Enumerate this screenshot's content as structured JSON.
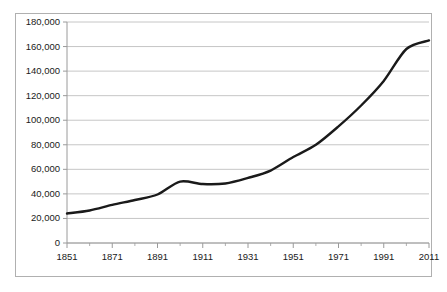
{
  "chart_data": {
    "type": "line",
    "title": "",
    "subtitle": "",
    "xlabel": "",
    "ylabel": "",
    "xlim": [
      1851,
      2011
    ],
    "ylim": [
      0,
      180000
    ],
    "grid": true,
    "grid_axis": "y",
    "legend": false,
    "legend_position": "none",
    "line_color": "#1a1a1a",
    "line_width": 2.4,
    "plot_background": "#ffffff",
    "gridline_color": "#bfbfbf",
    "axis_color": "#9a9a9a",
    "border_color": "#b0b0b0",
    "y_ticks": [
      0,
      20000,
      40000,
      60000,
      80000,
      100000,
      120000,
      140000,
      160000,
      180000
    ],
    "y_tick_labels": [
      "0",
      "20,000",
      "40,000",
      "60,000",
      "80,000",
      "100,000",
      "120,000",
      "140,000",
      "160,000",
      "180,000"
    ],
    "x_ticks": [
      1851,
      1871,
      1891,
      1911,
      1931,
      1951,
      1971,
      1991,
      2011
    ],
    "x_tick_labels": [
      "1851",
      "1871",
      "1891",
      "1911",
      "1931",
      "1951",
      "1971",
      "1991",
      "2011"
    ],
    "x_minor_ticks": [
      1861,
      1881,
      1901,
      1921,
      1941,
      1961,
      1981,
      2001
    ],
    "series": [
      {
        "name": "Population",
        "x": [
          1851,
          1861,
          1871,
          1881,
          1891,
          1901,
          1911,
          1921,
          1931,
          1941,
          1951,
          1961,
          1971,
          1981,
          1991,
          2001,
          2011
        ],
        "values": [
          24000,
          26500,
          31000,
          35500,
          39500,
          44000,
          50000,
          48500,
          49000,
          53000,
          59500,
          65500,
          71500,
          82000,
          95000,
          110000,
          126000
        ]
      }
    ],
    "points": [
      {
        "x": 1851,
        "y": 24000
      },
      {
        "x": 1861,
        "y": 26500
      },
      {
        "x": 1871,
        "y": 31000
      },
      {
        "x": 1881,
        "y": 35000
      },
      {
        "x": 1891,
        "y": 39500
      },
      {
        "x": 1901,
        "y": 50000
      },
      {
        "x": 1911,
        "y": 48000
      },
      {
        "x": 1921,
        "y": 48500
      },
      {
        "x": 1931,
        "y": 53000
      },
      {
        "x": 1941,
        "y": 59000
      },
      {
        "x": 1951,
        "y": 70000
      },
      {
        "x": 1961,
        "y": 80000
      },
      {
        "x": 1971,
        "y": 95000
      },
      {
        "x": 1981,
        "y": 112000
      },
      {
        "x": 1991,
        "y": 132000
      },
      {
        "x": 2001,
        "y": 158000
      },
      {
        "x": 2011,
        "y": 165000
      }
    ]
  }
}
